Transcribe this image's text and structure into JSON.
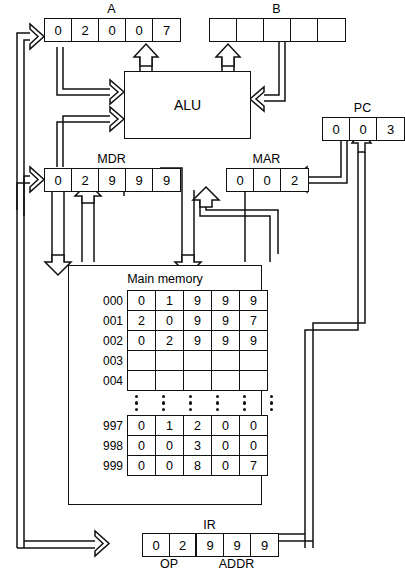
{
  "diagram": {
    "alu_label": "ALU",
    "memory_title": "Main memory"
  },
  "registers": {
    "a": {
      "label": "A",
      "cells": [
        "0",
        "2",
        "0",
        "0",
        "7"
      ]
    },
    "b": {
      "label": "B",
      "cells": [
        "",
        "",
        "",
        "",
        ""
      ]
    },
    "pc": {
      "label": "PC",
      "cells": [
        "0",
        "0",
        "3"
      ]
    },
    "mdr": {
      "label": "MDR",
      "cells": [
        "0",
        "2",
        "9",
        "9",
        "9"
      ]
    },
    "mar": {
      "label": "MAR",
      "cells": [
        "0",
        "0",
        "2"
      ]
    },
    "ir": {
      "label": "IR",
      "cells": [
        "0",
        "2",
        "9",
        "9",
        "9"
      ],
      "op_label": "OP",
      "addr_label": "ADDR"
    }
  },
  "memory": {
    "title": "Main memory",
    "top_rows": [
      {
        "addr": "000",
        "cells": [
          "0",
          "1",
          "9",
          "9",
          "9"
        ]
      },
      {
        "addr": "001",
        "cells": [
          "2",
          "0",
          "9",
          "9",
          "7"
        ]
      },
      {
        "addr": "002",
        "cells": [
          "0",
          "2",
          "9",
          "9",
          "9"
        ]
      },
      {
        "addr": "003",
        "cells": [
          "",
          "",
          "",
          "",
          ""
        ]
      },
      {
        "addr": "004",
        "cells": [
          "",
          "",
          "",
          "",
          ""
        ]
      }
    ],
    "ellipsis_columns": 6,
    "ellipsis_dots": 3,
    "bottom_rows": [
      {
        "addr": "997",
        "cells": [
          "0",
          "1",
          "2",
          "0",
          "0"
        ]
      },
      {
        "addr": "998",
        "cells": [
          "0",
          "0",
          "3",
          "0",
          "0"
        ]
      },
      {
        "addr": "999",
        "cells": [
          "0",
          "0",
          "8",
          "0",
          "7"
        ]
      }
    ]
  },
  "colors": {
    "line": "#111111",
    "background": "#ffffff"
  }
}
